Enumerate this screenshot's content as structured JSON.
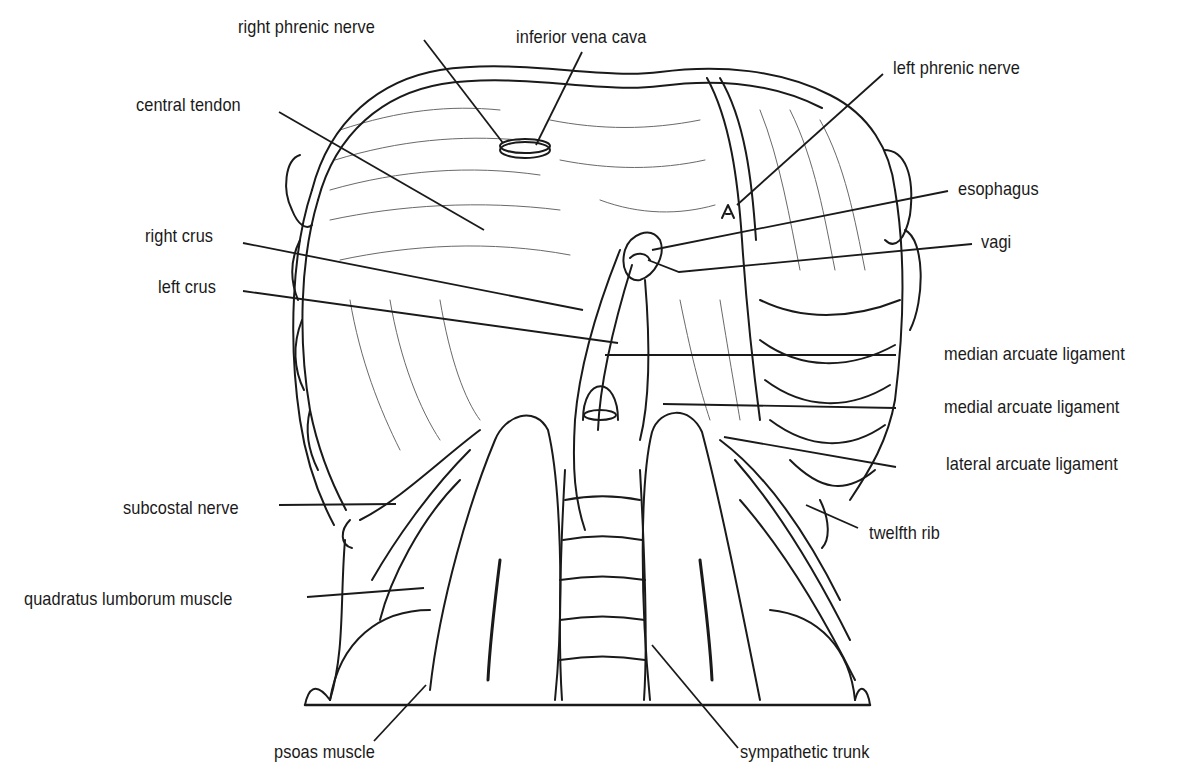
{
  "figure": {
    "ink_color": "#1a1a1a",
    "background": "#ffffff"
  },
  "labels": [
    {
      "id": "right-phrenic-nerve",
      "text": "right phrenic nerve",
      "x": 238,
      "y": 16,
      "line": [
        [
          424,
          40
        ],
        [
          503,
          143
        ]
      ]
    },
    {
      "id": "inferior-vena-cava",
      "text": "inferior vena cava",
      "x": 516,
      "y": 26,
      "line": [
        [
          582,
          52
        ],
        [
          536,
          145
        ]
      ]
    },
    {
      "id": "left-phrenic-nerve",
      "text": "left phrenic nerve",
      "x": 893,
      "y": 57,
      "line": [
        [
          883,
          74
        ],
        [
          737,
          205
        ]
      ]
    },
    {
      "id": "central-tendon",
      "text": "central tendon",
      "x": 136,
      "y": 94,
      "line": [
        [
          279,
          112
        ],
        [
          484,
          230
        ]
      ]
    },
    {
      "id": "esophagus",
      "text": "esophagus",
      "x": 958,
      "y": 178,
      "line": [
        [
          948,
          191
        ],
        [
          652,
          250
        ]
      ]
    },
    {
      "id": "vagi",
      "text": "vagi",
      "x": 981,
      "y": 231,
      "line": [
        [
          972,
          244
        ],
        [
          679,
          272
        ],
        [
          648,
          260
        ]
      ]
    },
    {
      "id": "right-crus",
      "text": "right crus",
      "x": 145,
      "y": 225,
      "line": [
        [
          243,
          243
        ],
        [
          583,
          310
        ]
      ]
    },
    {
      "id": "left-crus",
      "text": "left crus",
      "x": 158,
      "y": 276,
      "line": [
        [
          243,
          291
        ],
        [
          618,
          343
        ]
      ]
    },
    {
      "id": "median-arcuate-ligament",
      "text": "median arcuate ligament",
      "x": 944,
      "y": 343,
      "line": [
        [
          896,
          355
        ],
        [
          605,
          355
        ]
      ]
    },
    {
      "id": "medial-arcuate-ligament",
      "text": "medial arcuate ligament",
      "x": 944,
      "y": 396,
      "line": [
        [
          896,
          408
        ],
        [
          663,
          404
        ]
      ]
    },
    {
      "id": "lateral-arcuate-ligament",
      "text": "lateral arcuate ligament",
      "x": 946,
      "y": 453,
      "line": [
        [
          896,
          467
        ],
        [
          724,
          437
        ]
      ]
    },
    {
      "id": "subcostal-nerve",
      "text": "subcostal nerve",
      "x": 123,
      "y": 497,
      "line": [
        [
          279,
          505
        ],
        [
          396,
          504
        ]
      ]
    },
    {
      "id": "twelfth-rib",
      "text": "twelfth rib",
      "x": 869,
      "y": 522,
      "line": [
        [
          858,
          528
        ],
        [
          806,
          505
        ]
      ]
    },
    {
      "id": "quadratus-lumborum-muscle",
      "text": "quadratus lumborum muscle",
      "x": 24,
      "y": 588,
      "line": [
        [
          307,
          597
        ],
        [
          424,
          588
        ]
      ]
    },
    {
      "id": "psoas-muscle",
      "text": "psoas muscle",
      "x": 274,
      "y": 741,
      "line": [
        [
          374,
          741
        ],
        [
          426,
          685
        ]
      ]
    },
    {
      "id": "sympathetic-trunk",
      "text": "sympathetic trunk",
      "x": 740,
      "y": 741,
      "line": [
        [
          738,
          748
        ],
        [
          652,
          645
        ]
      ]
    }
  ]
}
